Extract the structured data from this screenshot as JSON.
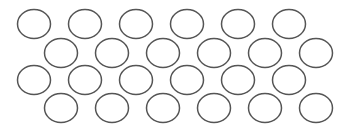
{
  "figure": {
    "width": 348,
    "height": 130,
    "background": "#ffffff",
    "shape": "ellipse",
    "stroke_color": "#555555",
    "stroke_width": 1.5,
    "fill": "none",
    "radius_x": 16.5,
    "radius_y": 14.5,
    "total_count": 24,
    "rows": [
      {
        "y": 24,
        "x": [
          34,
          85,
          136,
          187,
          238,
          289
        ]
      },
      {
        "y": 53,
        "x": [
          61,
          112,
          163,
          214,
          265,
          316
        ]
      },
      {
        "y": 80,
        "x": [
          34,
          85,
          136,
          187,
          238,
          289
        ]
      },
      {
        "y": 108,
        "x": [
          61,
          112,
          163,
          214,
          265,
          316
        ]
      }
    ]
  }
}
